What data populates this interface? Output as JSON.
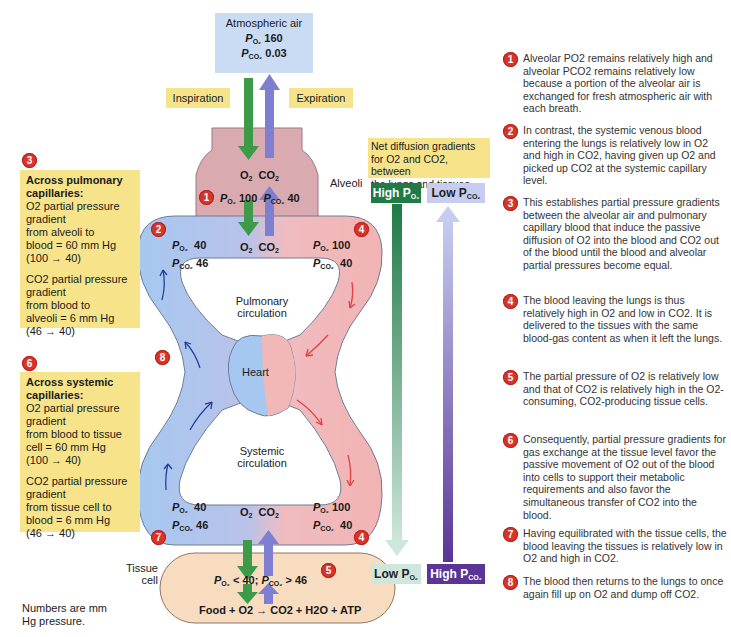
{
  "atmospheric": {
    "title": "Atmospheric air",
    "po2_label": "P",
    "po2_sub": "O2",
    "po2_value": "160",
    "pco2_label": "P",
    "pco2_sub": "CO2",
    "pco2_value": "0.03"
  },
  "inspiration_label": "Inspiration",
  "expiration_label": "Expiration",
  "alveoli": {
    "label": "Alveoli",
    "gas_o2": "O2",
    "gas_co2": "CO2",
    "po2_value": "100",
    "pco2_value": "40",
    "badge": "1"
  },
  "pulmonary": {
    "label_line1": "Pulmonary",
    "label_line2": "circulation",
    "left": {
      "po2": "40",
      "pco2": "46",
      "badge": "2"
    },
    "right": {
      "po2": "100",
      "pco2": "40",
      "badge": "4"
    },
    "gas_o2": "O2",
    "gas_co2": "CO2"
  },
  "heart_label": "Heart",
  "badge_8": "8",
  "systemic": {
    "label_line1": "Systemic",
    "label_line2": "circulation",
    "left": {
      "po2": "40",
      "pco2": "46",
      "badge": "7"
    },
    "right": {
      "po2": "100",
      "pco2": "40",
      "badge": "4"
    },
    "gas_o2": "O2",
    "gas_co2": "CO2"
  },
  "tissue": {
    "label_line1": "Tissue",
    "label_line2": "cell",
    "pressures": "< 40; ",
    "pressures2": "> 46",
    "equation": "Food + O2 → CO2 + H2O + ATP",
    "badge": "5"
  },
  "pulmonary_box": {
    "badge": "3",
    "title": "Across pulmonary capillaries:",
    "o2_text": [
      "O2 partial pressure",
      "gradient",
      "from alveoli to",
      "blood = 60 mm Hg",
      "(100 → 40)"
    ],
    "co2_text": [
      "CO2 partial pressure",
      "gradient",
      "from blood to",
      "alveoli = 6 mm Hg",
      "(46 → 40)"
    ]
  },
  "systemic_box": {
    "badge": "6",
    "title": "Across systemic capillaries:",
    "o2_text": [
      "O2 partial pressure",
      "gradient",
      "from blood to tissue",
      "cell = 60 mm Hg",
      "(100 → 40)"
    ],
    "co2_text": [
      "CO2 partial pressure",
      "gradient",
      "from tissue cell to",
      "blood = 6 mm Hg",
      "(46 → 40)"
    ]
  },
  "footnote": [
    "Numbers are mm",
    "Hg pressure."
  ],
  "gradients": {
    "title": [
      "Net diffusion gradients",
      "for O2 and CO2, between",
      "the lungs and tissues"
    ],
    "high_po2": "High P",
    "low_pco2": "Low P",
    "low_po2": "Low P",
    "high_pco2": "High P",
    "sub_o2": "O2",
    "sub_co2": "CO2"
  },
  "notes": [
    {
      "n": "1",
      "text": "Alveolar PO2 remains relatively high and alveolar PCO2 remains relatively low because a portion of the alveolar air is exchanged for fresh atmospheric air with each breath."
    },
    {
      "n": "2",
      "text": "In contrast, the systemic venous blood entering the lungs is relatively low in O2 and high in CO2, having given up O2 and picked up CO2 at the systemic capillary level."
    },
    {
      "n": "3",
      "text": "This establishes partial pressure gradients between the alveolar air and pulmonary capillary blood that induce the passive diffusion of O2 into the blood and CO2 out of the blood until the blood and alveolar partial pressures become equal."
    },
    {
      "n": "4",
      "text": "The blood leaving the lungs is thus relatively high in O2 and low in CO2. It is delivered to the tissues with the same blood-gas content as when it left the lungs."
    },
    {
      "n": "5",
      "text": "The partial pressure of O2 is relatively low and that of CO2 is relatively high in the O2-consuming, CO2-producing tissue cells."
    },
    {
      "n": "6",
      "text": "Consequently, partial pressure gradients for gas exchange at the tissue level favor the passive movement of O2 out of the blood into cells to support their metabolic requirements and also favor the simultaneous transfer of CO2 into the blood."
    },
    {
      "n": "7",
      "text": "Having equilibrated with the tissue cells, the blood leaving the tissues is relatively low in O2 and high in CO2."
    },
    {
      "n": "8",
      "text": "The blood then returns to the lungs to once again fill up on O2 and dump off CO2."
    }
  ],
  "colors": {
    "o2_green": "#3c9a48",
    "co2_purple": "#7f7fd1",
    "venous_blue": "#9fc3ef",
    "arterial_pink": "#f2b7b7",
    "alveoli": "#d9aab0",
    "atmos": "#c9dcf3",
    "tissue": "#f7dcc0",
    "yellow": "#f7e48a",
    "badge_red": "#d8342a",
    "dark_green": "#1f7a45",
    "dark_purple": "#5a3596"
  }
}
